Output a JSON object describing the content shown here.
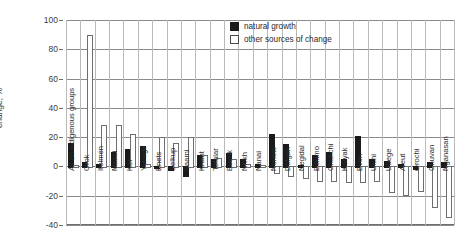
{
  "chart_data": {
    "type": "bar",
    "title": "",
    "xlabel": "",
    "ylabel": "change, %",
    "ylim": [
      -40,
      100
    ],
    "yticks": [
      100,
      80,
      60,
      40,
      20,
      0,
      -20,
      -40
    ],
    "grid": true,
    "legend_position": "top-right",
    "categories": [
      "All 26 indigenous groups",
      "Orok",
      "Itelmen",
      "Mansi",
      "Ket",
      "Yukagir",
      "Enets",
      "Selkup",
      "Saami",
      "Khant",
      "Tofalar",
      "Evenk",
      "Nivkh",
      "Nanai",
      "Nenets",
      "Dolgan",
      "Negidal",
      "Eskimo",
      "Chukchi",
      "Koryak",
      "Even",
      "Ulchi",
      "Udege",
      "Aleut",
      "Orochi",
      "Chuvan",
      "Nganasan"
    ],
    "series": [
      {
        "name": "natural growth",
        "color": "#1a1a1a",
        "values": [
          16,
          3,
          2,
          10,
          12,
          14,
          0,
          -2,
          -6,
          8,
          5,
          9,
          5,
          2,
          22,
          15,
          1,
          8,
          10,
          5,
          21,
          5,
          4,
          2,
          -1,
          3,
          3
        ]
      },
      {
        "name": "other sources of change",
        "color": "#ffffff",
        "values": [
          1,
          90,
          28,
          28,
          22,
          2,
          20,
          16,
          20,
          8,
          6,
          5,
          2,
          1,
          -4,
          -6,
          -7,
          -9,
          -9,
          -10,
          -10,
          -9,
          -17,
          -19,
          -16,
          -27,
          -34
        ]
      }
    ]
  },
  "legend": {
    "items": [
      {
        "label": "natural growth",
        "swatch": "filled-square-icon"
      },
      {
        "label": "other sources of change",
        "swatch": "outline-square-icon"
      }
    ]
  },
  "axis": {
    "y_label": "change, %",
    "y_tick_labels": [
      "100",
      "80",
      "60",
      "40",
      "20",
      "0",
      "-20",
      "-40"
    ]
  }
}
